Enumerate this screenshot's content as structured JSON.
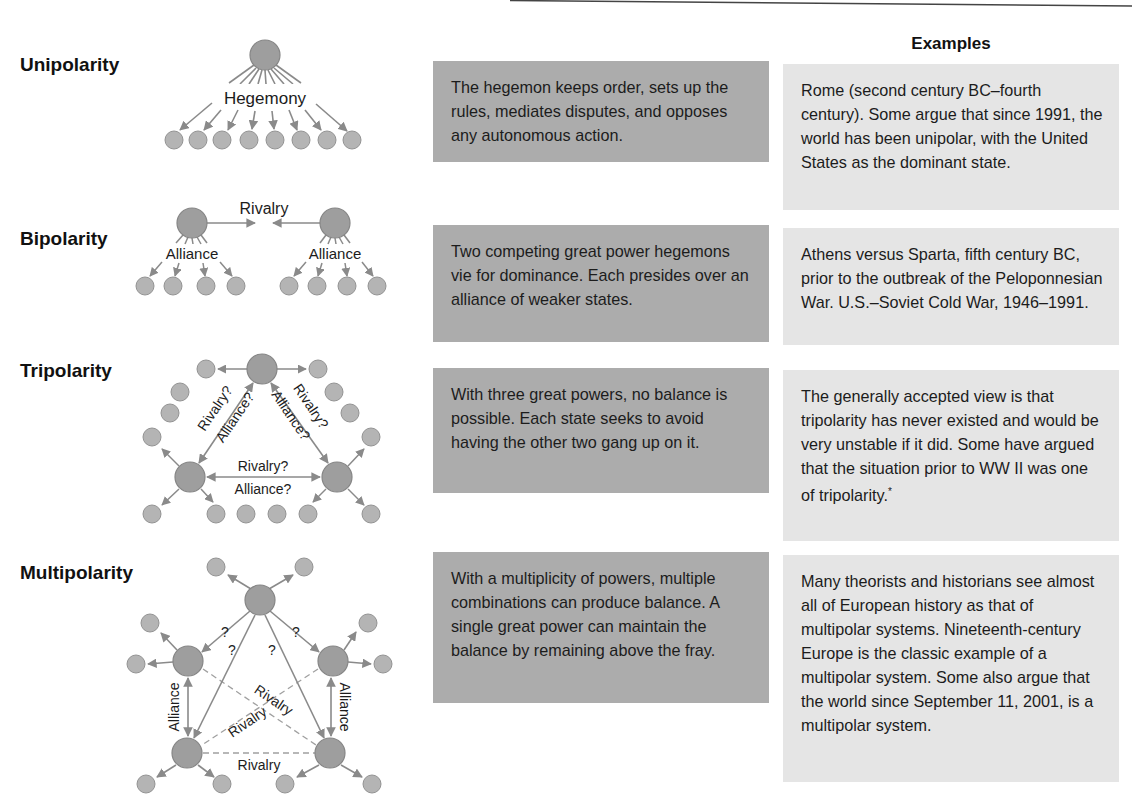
{
  "header": {
    "examples_title": "Examples"
  },
  "rows": [
    {
      "label": "Unipolarity",
      "description": "The hegemon keeps order, sets up the rules, mediates disputes, and opposes any autonomous action.",
      "example": "Rome (second century BC–fourth century). Some argue that since 1991, the world has been unipolar, with the United States as the dominant state.",
      "diagram_labels": {
        "hegemony": "Hegemony"
      }
    },
    {
      "label": "Bipolarity",
      "description": "Two competing great power hegemons vie for dominance. Each presides over an alliance of weaker states.",
      "example": "Athens versus Sparta, fifth century BC, prior to the outbreak of the Peloponnesian War. U.S.–Soviet Cold War, 1946–1991.",
      "diagram_labels": {
        "rivalry": "Rivalry",
        "alliance_left": "Alliance",
        "alliance_right": "Alliance"
      }
    },
    {
      "label": "Tripolarity",
      "description": "With three great powers, no balance is possible. Each state seeks to avoid having the other two gang up on it.",
      "example": "The generally accepted view is that tripolarity has never existed and would be very unstable if it did. Some have argued that the situation prior to WW II was one of tripolarity.",
      "example_footnote": "*",
      "diagram_labels": {
        "left_rivalry": "Rivalry?",
        "left_alliance": "Alliance?",
        "right_rivalry": "Rivalry?",
        "right_alliance": "Alliance?",
        "bottom_rivalry": "Rivalry?",
        "bottom_alliance": "Alliance?"
      }
    },
    {
      "label": "Multipolarity",
      "description": "With a multiplicity of powers, multiple combinations can produce balance.  A single great power can maintain the balance by remaining above the fray.",
      "example": "Many theorists and historians see almost all of European history as that of multipolar systems. Nineteenth-century Europe is the classic example of a multipolar system. Some also argue that the world since September 11, 2001, is a multipolar system.",
      "diagram_labels": {
        "q1": "?",
        "q2": "?",
        "q3": "?",
        "q4": "?",
        "alliance_left": "Alliance",
        "alliance_right": "Alliance",
        "rivalry_cross1": "Rivalry",
        "rivalry_cross2": "Rivalry",
        "rivalry_bottom": "Rivalry"
      }
    }
  ],
  "colors": {
    "dark_box": "#acacac",
    "light_box": "#e5e5e5",
    "hub_fill": "#9e9e9e",
    "node_fill": "#b4b4b4",
    "line": "#8a8a8a"
  }
}
